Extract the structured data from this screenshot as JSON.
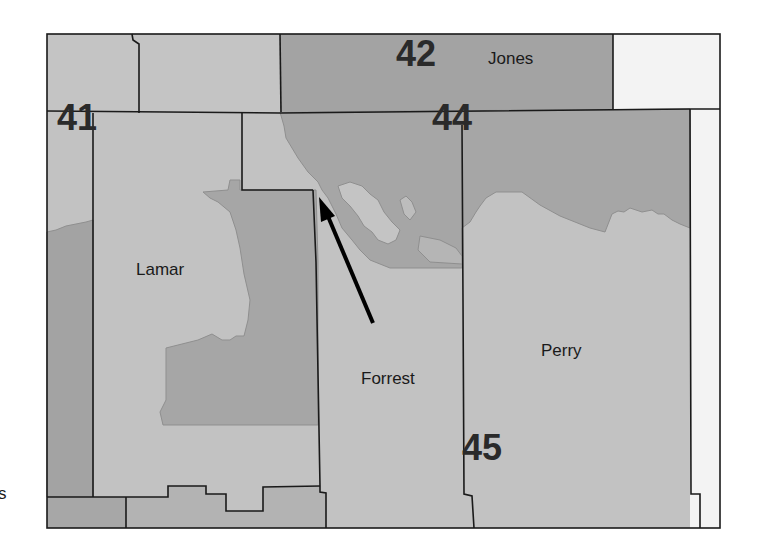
{
  "map": {
    "colors": {
      "light": "#c2c2c2",
      "medium": "#adadad",
      "dark": "#999999",
      "white": "#f4f4f4",
      "border": "#1a1a1a",
      "district_border": "#8a8a8a",
      "arrow": "#000000"
    },
    "counties": [
      {
        "name": "Lamar"
      },
      {
        "name": "Forrest"
      },
      {
        "name": "Perry"
      },
      {
        "name": "Jones"
      }
    ],
    "districts": [
      {
        "number": "41"
      },
      {
        "number": "42"
      },
      {
        "number": "44"
      },
      {
        "number": "45"
      }
    ],
    "edge_text": "s",
    "arrow": {
      "description": "arrow pointing to district boundary near Forrest/Lamar line"
    }
  }
}
